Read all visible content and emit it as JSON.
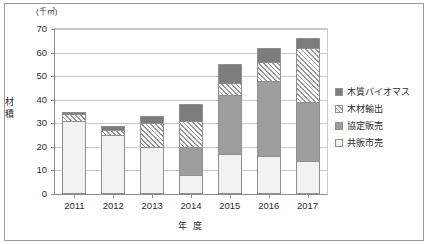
{
  "chart_data": {
    "type": "bar",
    "title": "",
    "subtitle": "",
    "unit_label": "(千㎥)",
    "xlabel": "年 度",
    "ylabel": "材積",
    "ylim": [
      0,
      70
    ],
    "yticks": [
      0,
      10,
      20,
      30,
      40,
      50,
      60,
      70
    ],
    "grid": true,
    "stacked": true,
    "legend_position": "right",
    "categories": [
      "2011",
      "2012",
      "2013",
      "2014",
      "2015",
      "2016",
      "2017"
    ],
    "series": [
      {
        "name": "共販市売",
        "color": "#f2f2f2",
        "values": [
          31,
          25,
          20,
          8,
          17,
          16,
          14
        ]
      },
      {
        "name": "協定販売",
        "color": "#9e9e9e",
        "values": [
          0,
          0,
          0,
          12,
          25,
          32,
          25
        ]
      },
      {
        "name": "木材輸出",
        "color": "#ffffff",
        "pattern": "diagonal-hatch",
        "values": [
          3,
          2,
          10,
          11,
          5,
          8,
          23
        ]
      },
      {
        "name": "木質バイオマス",
        "color": "#7d7d7d",
        "values": [
          1,
          2,
          3,
          7,
          8,
          6,
          4
        ]
      }
    ],
    "totals": [
      35,
      29,
      33,
      38,
      55,
      62,
      66
    ]
  },
  "legend": {
    "items": [
      {
        "label": "木質バイオマス",
        "swatch": "biomass-swatch"
      },
      {
        "label": "木材輸出",
        "swatch": "export-swatch"
      },
      {
        "label": "協定販売",
        "swatch": "agreement-swatch"
      },
      {
        "label": "共販市売",
        "swatch": "market-swatch"
      }
    ]
  }
}
